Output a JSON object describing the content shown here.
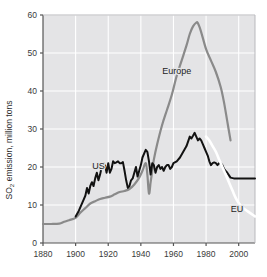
{
  "chart_data": {
    "type": "line",
    "title": "",
    "xlabel": "",
    "ylabel": "SO2 emission, million tons",
    "ylabel_main": "SO",
    "ylabel_sub": "2",
    "ylabel_rest": " emission, million tons",
    "xlim": [
      1880,
      2010
    ],
    "ylim": [
      0,
      60
    ],
    "xticks": [
      1880,
      1900,
      1920,
      1940,
      1960,
      1980,
      2000
    ],
    "yticks": [
      0,
      10,
      20,
      30,
      40,
      50,
      60
    ],
    "grid": true,
    "legend_position": "inline-annotations",
    "colors": {
      "europe": "#8a8a8a",
      "us": "#121212",
      "eu": "#ffffff",
      "plot_background": "#e4e4e6",
      "gridline": "#ffffff",
      "axis": "#555555",
      "page_background": "#ffffff"
    },
    "annotations": [
      {
        "text": "Europe",
        "x": 1962,
        "y": 44.5
      },
      {
        "text": "US",
        "x": 1914,
        "y": 19.6
      },
      {
        "text": "EU",
        "x": 1999,
        "y": 8.2
      }
    ],
    "series": [
      {
        "name": "Europe",
        "color": "#8a8a8a",
        "x": [
          1880,
          1885,
          1890,
          1893,
          1896,
          1900,
          1903,
          1906,
          1909,
          1912,
          1915,
          1918,
          1921,
          1924,
          1927,
          1930,
          1933,
          1936,
          1939,
          1941,
          1943,
          1944,
          1945,
          1946,
          1947,
          1948,
          1950,
          1953,
          1956,
          1959,
          1962,
          1965,
          1968,
          1970,
          1972,
          1974,
          1975,
          1977,
          1980,
          1983,
          1986,
          1989,
          1991,
          1993,
          1995
        ],
        "values": [
          5.0,
          5.0,
          5.1,
          5.6,
          6.0,
          6.6,
          8.0,
          9.2,
          10.4,
          11.0,
          11.6,
          11.9,
          12.2,
          12.8,
          13.4,
          13.7,
          14.2,
          15.4,
          17.2,
          19.0,
          21.0,
          18.0,
          13.0,
          16.0,
          19.0,
          22.0,
          26.0,
          31.0,
          35.0,
          39.0,
          44.0,
          48.0,
          52.0,
          55.0,
          57.0,
          58.0,
          57.8,
          55.5,
          51.0,
          48.0,
          45.0,
          41.0,
          37.0,
          32.0,
          27.0
        ]
      },
      {
        "name": "US",
        "color": "#121212",
        "x": [
          1900,
          1902,
          1904,
          1905,
          1906,
          1907,
          1908,
          1909,
          1910,
          1911,
          1912,
          1913,
          1914,
          1915,
          1916,
          1917,
          1918,
          1919,
          1920,
          1921,
          1922,
          1923,
          1924,
          1925,
          1926,
          1927,
          1928,
          1929,
          1930,
          1931,
          1932,
          1933,
          1934,
          1935,
          1936,
          1937,
          1938,
          1939,
          1940,
          1941,
          1942,
          1943,
          1944,
          1945,
          1946,
          1947,
          1948,
          1949,
          1950,
          1951,
          1952,
          1953,
          1954,
          1955,
          1956,
          1957,
          1958,
          1959,
          1960,
          1962,
          1964,
          1966,
          1968,
          1970,
          1971,
          1972,
          1973,
          1974,
          1975,
          1976,
          1977,
          1978,
          1979,
          1980,
          1981,
          1982,
          1983,
          1984,
          1985,
          1986,
          1987,
          1988,
          1989,
          1990,
          1991,
          1992,
          1993,
          1995,
          1997,
          2000,
          2003,
          2006,
          2010
        ],
        "values": [
          7.0,
          8.5,
          10.5,
          11.5,
          12.5,
          14.5,
          13.0,
          15.0,
          16.0,
          15.0,
          17.0,
          18.5,
          16.5,
          18.0,
          20.0,
          21.0,
          20.5,
          18.5,
          21.0,
          18.5,
          19.5,
          21.5,
          21.0,
          21.2,
          21.5,
          21.0,
          21.0,
          21.3,
          19.0,
          16.5,
          14.5,
          15.0,
          16.5,
          17.0,
          18.5,
          20.0,
          17.5,
          19.0,
          20.5,
          22.5,
          23.5,
          24.5,
          24.0,
          21.5,
          18.0,
          21.0,
          20.5,
          18.5,
          20.0,
          20.5,
          19.5,
          20.0,
          19.0,
          20.0,
          20.5,
          20.5,
          19.5,
          20.0,
          21.0,
          21.5,
          22.5,
          24.0,
          25.5,
          28.0,
          27.5,
          28.2,
          29.0,
          28.0,
          27.0,
          27.5,
          27.0,
          26.0,
          25.0,
          24.0,
          23.0,
          21.5,
          20.5,
          21.0,
          21.2,
          21.0,
          20.5,
          21.0,
          21.0,
          20.5,
          19.5,
          19.0,
          18.5,
          17.2,
          17.0,
          17.0,
          17.0,
          17.0,
          17.0
        ]
      },
      {
        "name": "EU",
        "color": "#ffffff",
        "x": [
          1980,
          1982,
          1984,
          1986,
          1988,
          1990,
          1992,
          1994,
          1996,
          1998,
          2000,
          2002,
          2004,
          2006,
          2008,
          2010
        ],
        "values": [
          28.0,
          27.0,
          25.5,
          24.0,
          22.0,
          20.0,
          18.0,
          16.0,
          14.0,
          12.0,
          10.5,
          9.5,
          8.8,
          8.2,
          7.6,
          7.0
        ]
      }
    ]
  }
}
